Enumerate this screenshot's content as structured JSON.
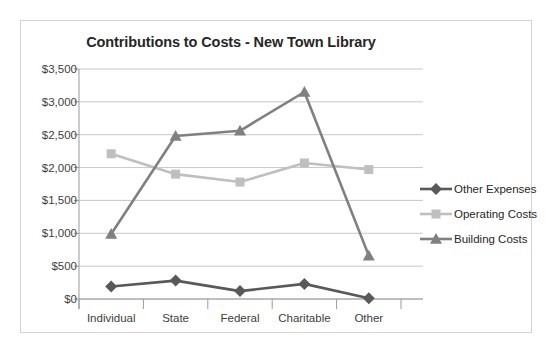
{
  "chart_data": {
    "type": "line",
    "title": "Contributions to Costs - New Town Library",
    "xlabel": "",
    "ylabel": "",
    "categories": [
      "Individual",
      "State",
      "Federal",
      "Charitable",
      "Other"
    ],
    "series": [
      {
        "name": "Other Expenses",
        "marker": "diamond",
        "color": "#595959",
        "values": [
          190,
          280,
          120,
          230,
          10
        ]
      },
      {
        "name": "Operating Costs",
        "marker": "square",
        "color": "#bfbfbf",
        "values": [
          2210,
          1900,
          1780,
          2070,
          1970
        ]
      },
      {
        "name": "Building Costs",
        "marker": "triangle",
        "color": "#808080",
        "values": [
          990,
          2480,
          2560,
          3150,
          660
        ]
      }
    ],
    "ylim": [
      0,
      3500
    ],
    "ytick_values": [
      0,
      500,
      1000,
      1500,
      2000,
      2500,
      3000,
      3500
    ],
    "ytick_labels": [
      "$0",
      "$500",
      "$1,000",
      "$1,500",
      "$2,000",
      "$2,500",
      "$3,000",
      "$3,500"
    ],
    "grid": true,
    "legend_position": "right"
  },
  "axis": {
    "gridline_color": "#c8c8c8",
    "axis_color": "#9a9a9a",
    "tick_text_color": "#404040"
  },
  "frame": {
    "border_color": "#d4d4d4",
    "background": "#ffffff"
  }
}
